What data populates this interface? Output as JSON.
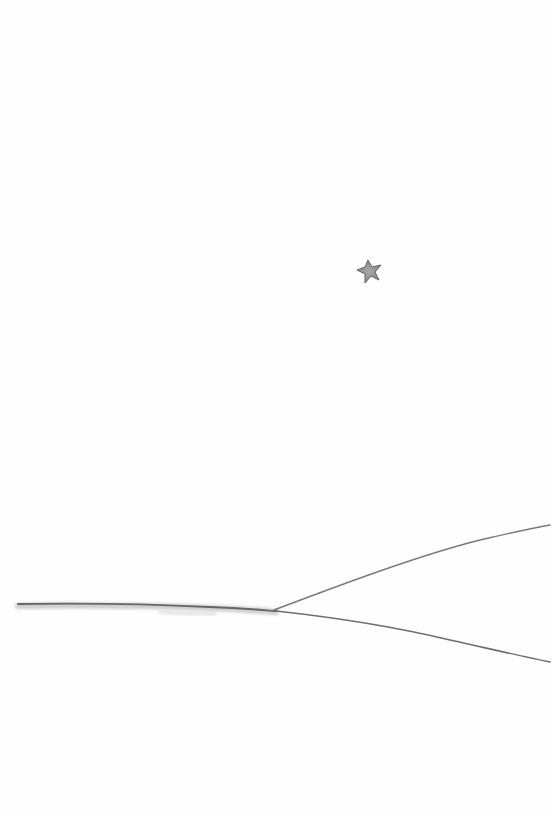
{
  "image": {
    "description": "Minimalist watercolor illustration: a single small grey star in an empty white sky above a long thin horizon line that forks into two diverging lines toward the right.",
    "background_color": "#fefefe",
    "elements": {
      "star": {
        "icon": "star-icon",
        "color": "#8a8a8a",
        "outline_color": "#555555",
        "center": [
          370,
          271
        ]
      },
      "horizon": {
        "color": "#6e6e6e",
        "wash_color": "#bdbdbd"
      },
      "upper_branch": {
        "color": "#7a7a7a"
      },
      "lower_branch": {
        "color": "#6e6e6e"
      }
    }
  }
}
